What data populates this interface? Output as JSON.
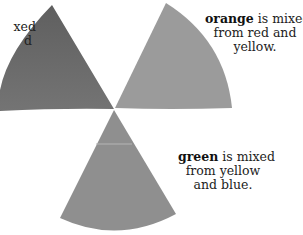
{
  "wedges": [
    {
      "name": "purple",
      "fill": "#6e6e6e"
    },
    {
      "name": "orange",
      "fill": "#9a9a9a"
    },
    {
      "name": "green",
      "fill": "#8e8e8e"
    }
  ],
  "captions": {
    "left": {
      "line1": "xed",
      "line2": "d"
    },
    "orange": {
      "bold": "orange",
      "rest1": " is mixed",
      "line2": "from red and",
      "line3": "yellow."
    },
    "green": {
      "bold": "green",
      "rest1": " is mixed",
      "line2": "from yellow",
      "line3": "and blue."
    }
  }
}
